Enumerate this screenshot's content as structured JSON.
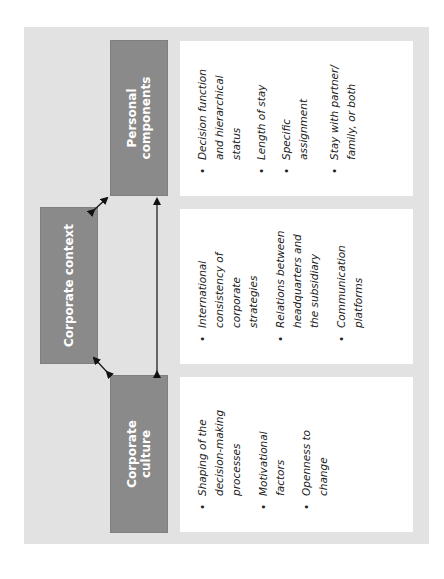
{
  "diagram": {
    "boxes": {
      "corporate_culture": "Corporate culture",
      "corporate_context": "Corporate context",
      "personal_components": "Personal components"
    },
    "culture_items": [
      "Shaping of the decision-making processes",
      "Motivational factors",
      "Openness to change"
    ],
    "context_items": [
      "International consistency of corporate strategies",
      "Relations between headquarters and the subsidiary",
      "Communication platforms"
    ],
    "personal_items": [
      "Decision function and hierarchical status",
      "Length of stay",
      "Specific assignment",
      "Stay with partner/ family, or both"
    ],
    "bullet": "•",
    "colors": {
      "background": "#e2e2e2",
      "header_box": "#8a8a8a",
      "panel": "#ffffff",
      "arrow": "#111111"
    }
  }
}
